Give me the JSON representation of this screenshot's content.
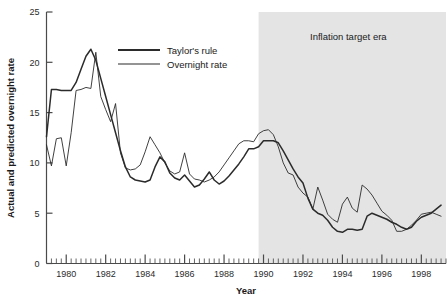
{
  "chart_data": {
    "type": "line",
    "title": "",
    "xlabel": "Year",
    "ylabel": "Actual and predicted overnight rate",
    "xlim": [
      1979.0,
      1999.25
    ],
    "ylim": [
      0,
      25
    ],
    "yticks": [
      0,
      5,
      10,
      15,
      20,
      25
    ],
    "ytick_labels": [
      "0",
      "5",
      "10",
      "15",
      "20",
      "25"
    ],
    "xticks": [
      1980,
      1982,
      1984,
      1986,
      1988,
      1990,
      1992,
      1994,
      1996,
      1998
    ],
    "xtick_labels": [
      "1980",
      "1982",
      "1984",
      "1986",
      "1988",
      "1990",
      "1992",
      "1994",
      "1996",
      "1998"
    ],
    "minor_xtick_interval": 0.25,
    "grid": false,
    "legend_position": "upper-center-left",
    "annotations": [
      {
        "name": "inflation-target-era",
        "text": "Inflation target era",
        "x": 1994.3,
        "y": 22.2,
        "shaded_region": {
          "x_start": 1989.75,
          "x_end": 1999.25,
          "color": "#e4e4e4"
        }
      }
    ],
    "series": [
      {
        "name": "Taylor's rule",
        "color": "#2b2b2b",
        "line_width": 1.5,
        "x": [
          1979.0,
          1979.25,
          1979.5,
          1979.75,
          1980.0,
          1980.25,
          1980.5,
          1980.75,
          1981.0,
          1981.25,
          1981.5,
          1981.75,
          1982.0,
          1982.25,
          1982.5,
          1982.75,
          1983.0,
          1983.25,
          1983.5,
          1983.75,
          1984.0,
          1984.25,
          1984.5,
          1984.75,
          1985.0,
          1985.25,
          1985.5,
          1985.75,
          1986.0,
          1986.25,
          1986.5,
          1986.75,
          1987.0,
          1987.25,
          1987.5,
          1987.75,
          1988.0,
          1988.25,
          1988.5,
          1988.75,
          1989.0,
          1989.25,
          1989.5,
          1989.75,
          1990.0,
          1990.25,
          1990.5,
          1990.75,
          1991.0,
          1991.25,
          1991.5,
          1991.75,
          1992.0,
          1992.25,
          1992.5,
          1992.75,
          1993.0,
          1993.25,
          1993.5,
          1993.75,
          1994.0,
          1994.25,
          1994.5,
          1994.75,
          1995.0,
          1995.25,
          1995.5,
          1995.75,
          1996.0,
          1996.25,
          1996.5,
          1996.75,
          1997.0,
          1997.25,
          1997.5,
          1997.75,
          1998.0,
          1998.25,
          1998.5,
          1998.75,
          1999.0
        ],
        "y": [
          12.6,
          17.3,
          17.3,
          17.2,
          17.2,
          17.2,
          18.0,
          19.3,
          20.6,
          21.3,
          20.2,
          18.4,
          16.6,
          14.8,
          13.0,
          11.2,
          9.6,
          8.6,
          8.3,
          8.2,
          8.1,
          8.3,
          9.6,
          10.6,
          10.1,
          9.0,
          8.5,
          8.3,
          8.8,
          8.2,
          7.6,
          7.8,
          8.4,
          9.1,
          8.3,
          7.9,
          8.2,
          8.7,
          9.3,
          9.9,
          10.6,
          11.4,
          11.4,
          11.6,
          12.2,
          12.2,
          12.2,
          12.0,
          11.2,
          10.3,
          9.4,
          8.6,
          8.0,
          6.5,
          5.4,
          5.0,
          4.8,
          4.3,
          3.6,
          3.2,
          3.1,
          3.4,
          3.4,
          3.3,
          3.4,
          4.7,
          5.0,
          4.8,
          4.6,
          4.4,
          4.1,
          3.9,
          3.6,
          3.4,
          3.6,
          4.2,
          4.6,
          4.8,
          5.0,
          5.4,
          5.8
        ]
      },
      {
        "name": "Overnight rate",
        "color": "#2b2b2b",
        "line_width": 0.9,
        "x": [
          1979.0,
          1979.25,
          1979.5,
          1979.75,
          1980.0,
          1980.25,
          1980.5,
          1980.75,
          1981.0,
          1981.25,
          1981.5,
          1981.75,
          1982.0,
          1982.25,
          1982.5,
          1982.75,
          1983.0,
          1983.25,
          1983.5,
          1983.75,
          1984.0,
          1984.25,
          1984.5,
          1984.75,
          1985.0,
          1985.25,
          1985.5,
          1985.75,
          1986.0,
          1986.25,
          1986.5,
          1986.75,
          1987.0,
          1987.25,
          1987.5,
          1987.75,
          1988.0,
          1988.25,
          1988.5,
          1988.75,
          1989.0,
          1989.25,
          1989.5,
          1989.75,
          1990.0,
          1990.25,
          1990.5,
          1990.75,
          1991.0,
          1991.25,
          1991.5,
          1991.75,
          1992.0,
          1992.25,
          1992.5,
          1992.75,
          1993.0,
          1993.25,
          1993.5,
          1993.75,
          1994.0,
          1994.25,
          1994.5,
          1994.75,
          1995.0,
          1995.25,
          1995.5,
          1995.75,
          1996.0,
          1996.25,
          1996.5,
          1996.75,
          1997.0,
          1997.25,
          1997.5,
          1997.75,
          1998.0,
          1998.25,
          1998.5,
          1998.75,
          1999.0
        ],
        "y": [
          11.8,
          9.7,
          12.4,
          12.5,
          9.7,
          13.0,
          17.2,
          17.3,
          17.5,
          17.4,
          21.0,
          16.6,
          15.3,
          14.1,
          15.9,
          11.0,
          9.5,
          9.3,
          9.4,
          9.8,
          11.1,
          12.6,
          11.8,
          11.0,
          10.0,
          9.2,
          8.9,
          9.1,
          11.0,
          8.9,
          8.4,
          8.3,
          8.1,
          8.3,
          8.6,
          9.1,
          9.8,
          10.5,
          11.2,
          11.9,
          12.2,
          12.2,
          12.1,
          12.9,
          13.2,
          13.3,
          12.8,
          11.6,
          10.0,
          9.0,
          8.8,
          7.6,
          7.0,
          6.6,
          5.4,
          7.6,
          6.3,
          4.9,
          4.4,
          4.1,
          5.9,
          6.6,
          5.5,
          5.1,
          7.8,
          7.4,
          6.8,
          6.0,
          5.2,
          4.8,
          4.3,
          3.2,
          3.2,
          3.4,
          3.8,
          4.3,
          4.9,
          5.0,
          5.1,
          4.9,
          4.7
        ]
      }
    ]
  },
  "legend": {
    "items": [
      {
        "label": "Taylor's rule"
      },
      {
        "label": "Overnight rate"
      }
    ]
  }
}
